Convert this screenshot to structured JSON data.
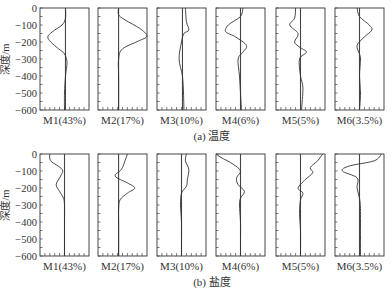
{
  "chart_data": [
    {
      "type": "line",
      "title": "(a) 温度",
      "ylabel": "深度/m",
      "ylim": [
        -600,
        0
      ],
      "yticks": [
        0,
        -100,
        -200,
        -300,
        -400,
        -500,
        -600
      ],
      "grid": false,
      "note": "x values are normalized anomaly positions within each panel (0 = left edge, 1 = right edge); the vertical reference line marks zero anomaly",
      "panels": [
        {
          "label": "M1(43%)",
          "ref": 0.52,
          "points": [
            [
              0,
              0.52
            ],
            [
              -60,
              0.52
            ],
            [
              -100,
              0.45
            ],
            [
              -140,
              0.25
            ],
            [
              -170,
              0.16
            ],
            [
              -200,
              0.22
            ],
            [
              -240,
              0.38
            ],
            [
              -270,
              0.5
            ],
            [
              -320,
              0.55
            ],
            [
              -400,
              0.52
            ],
            [
              -500,
              0.5
            ],
            [
              -600,
              0.5
            ]
          ]
        },
        {
          "label": "M2(17%)",
          "ref": 0.42,
          "points": [
            [
              0,
              0.42
            ],
            [
              -40,
              0.42
            ],
            [
              -70,
              0.55
            ],
            [
              -120,
              0.85
            ],
            [
              -165,
              1.0
            ],
            [
              -195,
              0.82
            ],
            [
              -240,
              0.5
            ],
            [
              -300,
              0.42
            ],
            [
              -400,
              0.42
            ],
            [
              -500,
              0.42
            ],
            [
              -600,
              0.42
            ]
          ]
        },
        {
          "label": "M3(10%)",
          "ref": 0.52,
          "points": [
            [
              0,
              0.58
            ],
            [
              -80,
              0.6
            ],
            [
              -130,
              0.65
            ],
            [
              -150,
              0.55
            ],
            [
              -200,
              0.5
            ],
            [
              -300,
              0.45
            ],
            [
              -400,
              0.52
            ],
            [
              -500,
              0.54
            ],
            [
              -600,
              0.55
            ]
          ]
        },
        {
          "label": "M4(6%)",
          "ref": 0.5,
          "points": [
            [
              0,
              0.55
            ],
            [
              -50,
              0.5
            ],
            [
              -100,
              0.25
            ],
            [
              -140,
              0.2
            ],
            [
              -170,
              0.4
            ],
            [
              -220,
              0.62
            ],
            [
              -260,
              0.55
            ],
            [
              -300,
              0.45
            ],
            [
              -400,
              0.48
            ],
            [
              -500,
              0.5
            ],
            [
              -600,
              0.52
            ]
          ]
        },
        {
          "label": "M5(5%)",
          "ref": 0.5,
          "points": [
            [
              0,
              0.4
            ],
            [
              -60,
              0.38
            ],
            [
              -100,
              0.28
            ],
            [
              -150,
              0.45
            ],
            [
              -200,
              0.38
            ],
            [
              -230,
              0.48
            ],
            [
              -260,
              0.62
            ],
            [
              -300,
              0.48
            ],
            [
              -400,
              0.5
            ],
            [
              -470,
              0.55
            ],
            [
              -600,
              0.52
            ]
          ]
        },
        {
          "label": "M6(3.5%)",
          "ref": 0.5,
          "points": [
            [
              0,
              0.45
            ],
            [
              -50,
              0.5
            ],
            [
              -100,
              0.7
            ],
            [
              -130,
              0.75
            ],
            [
              -170,
              0.6
            ],
            [
              -220,
              0.45
            ],
            [
              -270,
              0.5
            ],
            [
              -300,
              0.52
            ],
            [
              -400,
              0.5
            ],
            [
              -500,
              0.52
            ],
            [
              -600,
              0.5
            ]
          ]
        }
      ]
    },
    {
      "type": "line",
      "title": "(b) 盐度",
      "ylabel": "深度/m",
      "ylim": [
        -600,
        0
      ],
      "yticks": [
        0,
        -100,
        -200,
        -300,
        -400,
        -500,
        -600
      ],
      "grid": false,
      "panels": [
        {
          "label": "M1(43%)",
          "ref": 0.5,
          "points": [
            [
              0,
              0.2
            ],
            [
              -40,
              0.22
            ],
            [
              -90,
              0.45
            ],
            [
              -130,
              0.42
            ],
            [
              -180,
              0.33
            ],
            [
              -220,
              0.4
            ],
            [
              -260,
              0.48
            ],
            [
              -300,
              0.5
            ],
            [
              -400,
              0.5
            ],
            [
              -500,
              0.5
            ],
            [
              -600,
              0.5
            ]
          ]
        },
        {
          "label": "M2(17%)",
          "ref": 0.42,
          "points": [
            [
              0,
              0.6
            ],
            [
              -40,
              0.55
            ],
            [
              -90,
              0.48
            ],
            [
              -130,
              0.35
            ],
            [
              -170,
              0.6
            ],
            [
              -200,
              0.75
            ],
            [
              -230,
              0.6
            ],
            [
              -270,
              0.45
            ],
            [
              -320,
              0.42
            ],
            [
              -400,
              0.42
            ],
            [
              -500,
              0.42
            ],
            [
              -600,
              0.42
            ]
          ]
        },
        {
          "label": "M3(10%)",
          "ref": 0.5,
          "points": [
            [
              0,
              0.6
            ],
            [
              -40,
              0.58
            ],
            [
              -90,
              0.65
            ],
            [
              -150,
              0.62
            ],
            [
              -190,
              0.6
            ],
            [
              -230,
              0.5
            ],
            [
              -300,
              0.48
            ],
            [
              -400,
              0.5
            ],
            [
              -500,
              0.5
            ],
            [
              -600,
              0.5
            ]
          ]
        },
        {
          "label": "M4(6%)",
          "ref": 0.5,
          "points": [
            [
              0,
              0.0
            ],
            [
              -20,
              0.1
            ],
            [
              -60,
              0.35
            ],
            [
              -100,
              0.5
            ],
            [
              -140,
              0.42
            ],
            [
              -180,
              0.45
            ],
            [
              -220,
              0.58
            ],
            [
              -260,
              0.5
            ],
            [
              -300,
              0.48
            ],
            [
              -400,
              0.5
            ],
            [
              -500,
              0.5
            ],
            [
              -600,
              0.5
            ]
          ]
        },
        {
          "label": "M5(5%)",
          "ref": 0.5,
          "points": [
            [
              0,
              0.95
            ],
            [
              -40,
              0.85
            ],
            [
              -80,
              0.7
            ],
            [
              -110,
              0.75
            ],
            [
              -150,
              0.6
            ],
            [
              -200,
              0.45
            ],
            [
              -230,
              0.55
            ],
            [
              -270,
              0.5
            ],
            [
              -350,
              0.48
            ],
            [
              -450,
              0.5
            ],
            [
              -600,
              0.5
            ]
          ]
        },
        {
          "label": "M6(3.5%)",
          "ref": 0.5,
          "points": [
            [
              0,
              0.95
            ],
            [
              -40,
              0.8
            ],
            [
              -70,
              0.3
            ],
            [
              -100,
              0.15
            ],
            [
              -140,
              0.45
            ],
            [
              -200,
              0.45
            ],
            [
              -260,
              0.5
            ],
            [
              -320,
              0.52
            ],
            [
              -400,
              0.52
            ],
            [
              -500,
              0.52
            ],
            [
              -600,
              0.52
            ]
          ]
        }
      ]
    }
  ]
}
